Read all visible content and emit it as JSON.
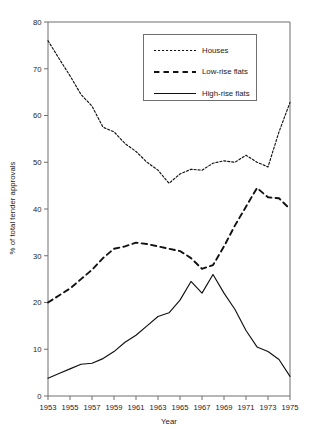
{
  "chart_data": {
    "type": "line",
    "title": "",
    "xlabel": "Year",
    "ylabel": "% of total tender approvals",
    "xlim": [
      1953,
      1975
    ],
    "ylim": [
      0,
      80
    ],
    "grid": false,
    "legend_position": "top-center",
    "x": [
      1953,
      1954,
      1955,
      1956,
      1957,
      1958,
      1959,
      1960,
      1961,
      1962,
      1963,
      1964,
      1965,
      1966,
      1967,
      1968,
      1969,
      1970,
      1971,
      1972,
      1973,
      1974,
      1975
    ],
    "xticks": [
      "1953",
      "1955",
      "1957",
      "1959",
      "1961",
      "1963",
      "1965",
      "1967",
      "1969",
      "1971",
      "1973",
      "1975"
    ],
    "xtick_values": [
      1953,
      1955,
      1957,
      1959,
      1961,
      1963,
      1965,
      1967,
      1969,
      1971,
      1973,
      1975
    ],
    "yticks": [
      "0",
      "10",
      "20",
      "30",
      "40",
      "50",
      "60",
      "70",
      "80"
    ],
    "ytick_values": [
      0,
      10,
      20,
      30,
      40,
      50,
      60,
      70,
      80
    ],
    "series": [
      {
        "name": "Houses",
        "style": "dotted",
        "color": "#111111",
        "values": [
          76.0,
          72.2,
          68.5,
          64.5,
          62.0,
          57.5,
          56.5,
          54.0,
          52.3,
          50.0,
          48.3,
          45.5,
          47.5,
          48.5,
          48.3,
          49.8,
          50.3,
          50.0,
          51.5,
          50.0,
          49.0,
          56.5,
          62.8
        ]
      },
      {
        "name": "Low-rise flats",
        "style": "dashed",
        "color": "#111111",
        "values": [
          20.0,
          21.5,
          23.0,
          25.0,
          27.0,
          29.5,
          31.5,
          32.0,
          32.8,
          32.5,
          32.0,
          31.5,
          31.0,
          29.5,
          27.2,
          28.0,
          32.0,
          36.5,
          40.5,
          44.5,
          42.5,
          42.3,
          40.0
        ]
      },
      {
        "name": "High-rise flats",
        "style": "solid",
        "color": "#111111",
        "values": [
          3.8,
          4.8,
          5.8,
          6.8,
          7.0,
          8.0,
          9.5,
          11.5,
          13.0,
          15.0,
          17.0,
          17.8,
          20.5,
          24.5,
          22.0,
          26.0,
          22.0,
          18.5,
          14.0,
          10.5,
          9.5,
          7.8,
          4.2
        ]
      }
    ],
    "annotations": []
  },
  "legend": {
    "entries": [
      {
        "label": "Houses",
        "style": "dotted"
      },
      {
        "label": "Low-rise flats",
        "style": "dashed"
      },
      {
        "label": "High-rise flats",
        "style": "solid"
      }
    ]
  }
}
